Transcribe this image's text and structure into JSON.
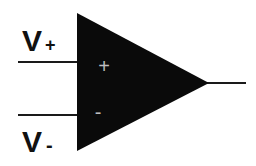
{
  "diagram": {
    "type": "op-amp symbol",
    "colors": {
      "background": "#ffffff",
      "triangle_fill": "#0a0a0a",
      "lines": "#1a1a1a",
      "labels": "#111111",
      "inner_signs": "#bdbdbd"
    },
    "inputs": {
      "non_inverting": {
        "label": "V",
        "subscript": "+",
        "inner_sign": "+"
      },
      "inverting": {
        "label": "V",
        "subscript": "-",
        "inner_sign": "-"
      }
    },
    "output": {
      "label": ""
    }
  }
}
